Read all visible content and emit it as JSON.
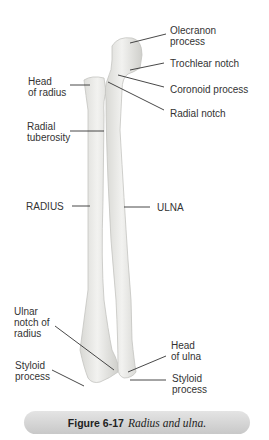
{
  "labels": {
    "olecranon": "Olecranon\nprocess",
    "trochlear": "Trochlear notch",
    "coronoid": "Coronoid process",
    "radial_notch": "Radial notch",
    "head_radius": "Head\nof radius",
    "radial_tuberosity": "Radial\ntuberosity",
    "radius": "RADIUS",
    "ulna": "ULNA",
    "ulnar_notch": "Ulnar\nnotch of\nradius",
    "styloid_radius": "Styloid\nprocess",
    "head_ulna": "Head\nof ulna",
    "styloid_ulna": "Styloid\nprocess"
  },
  "caption": {
    "number": "Figure 6-17",
    "title": "Radius and ulna."
  },
  "colors": {
    "bone_fill": "#ececea",
    "bone_shade": "#d2d2ce",
    "leader_line": "#333333",
    "caption_bg": "#d6d6d6"
  }
}
